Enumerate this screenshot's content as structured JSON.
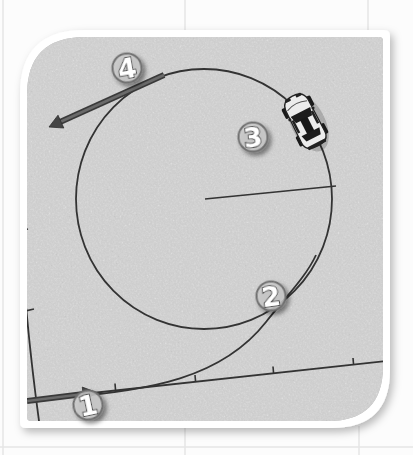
{
  "markers": [
    {
      "label": "1"
    },
    {
      "label": "2"
    },
    {
      "label": "3"
    },
    {
      "label": "4"
    }
  ],
  "icons": {
    "car": "car-top-view-icon",
    "entry_arrow": "entry-arrow-icon",
    "exit_arrow": "exit-arrow-icon"
  },
  "colors": {
    "page_background": "#fcfcfc",
    "grid_line": "#e6e6e6",
    "card_border": "#ffffff",
    "asphalt_base": "#a9a9a9",
    "path_line": "#333333",
    "arrow": "#4e4e4e",
    "badge_fill": "#cdcdcd",
    "badge_ring": "#6f6f6f",
    "badge_number": "#ffffff"
  }
}
